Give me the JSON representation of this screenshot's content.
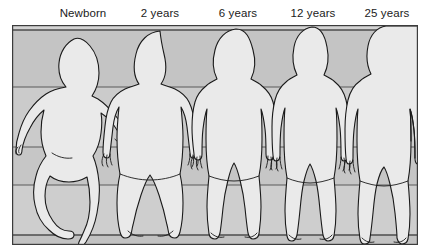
{
  "illustration": {
    "title": "Human body proportion change with age",
    "subject": "body-proportion-silhouettes",
    "panel": {
      "background_color": "#c8c8c8",
      "band_color": "#bdbdbd",
      "border_color": "#3c3c3c",
      "gridline_color": "#4a4a4a",
      "figure_fill": "#e9e9e9",
      "figure_outline": "#1a1a1a",
      "gridline_count": 4
    },
    "labels": [
      {
        "id": "newborn",
        "text": "Newborn",
        "center_x": 83
      },
      {
        "id": "2-years",
        "text": "2 years",
        "center_x": 160
      },
      {
        "id": "6-years",
        "text": "6 years",
        "center_x": 238
      },
      {
        "id": "12-years",
        "text": "12 years",
        "center_x": 313
      },
      {
        "id": "25-years",
        "text": "25 years",
        "center_x": 387
      }
    ],
    "figures": [
      {
        "id": "newborn",
        "label": "Newborn",
        "pose": "curled-flexed-limbs",
        "relative_height": 0.78,
        "head_to_body_ratio": "1:4"
      },
      {
        "id": "2-years",
        "label": "2 years",
        "pose": "standing-arms-down",
        "relative_height": 0.86,
        "head_to_body_ratio": "1:5"
      },
      {
        "id": "6-years",
        "label": "6 years",
        "pose": "standing-arms-down",
        "relative_height": 0.88,
        "head_to_body_ratio": "1:6"
      },
      {
        "id": "12-years",
        "label": "12 years",
        "pose": "standing-arms-down",
        "relative_height": 0.92,
        "head_to_body_ratio": "1:7"
      },
      {
        "id": "25-years",
        "label": "25 years",
        "pose": "standing-arms-down",
        "relative_height": 0.95,
        "head_to_body_ratio": "1:8"
      }
    ]
  }
}
